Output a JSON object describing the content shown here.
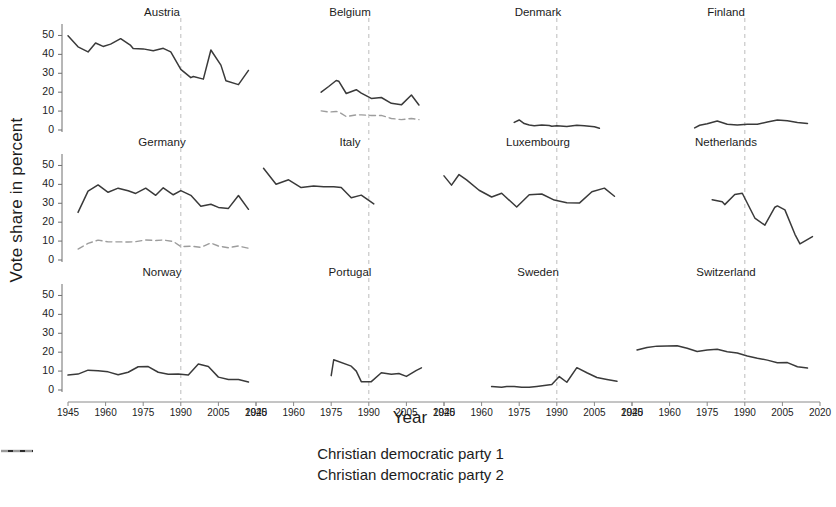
{
  "chart_data": {
    "type": "line",
    "title": "",
    "xlabel": "Year",
    "ylabel": "Vote share in percent",
    "xlim": [
      1945,
      2020
    ],
    "ylim": [
      0,
      55
    ],
    "yticks": [
      0,
      10,
      20,
      30,
      40,
      50
    ],
    "xticks": [
      1945,
      1960,
      1975,
      1990,
      2005,
      2020
    ],
    "xtick_labels": [
      "1945",
      "1960",
      "1975",
      "1990",
      "2005",
      "2020"
    ],
    "ytick_labels": [
      "0",
      "10",
      "20",
      "30",
      "40",
      "50"
    ],
    "grid": false,
    "legend_position": "bottom",
    "reference_line_x": 1990,
    "reference_line_style": "dashed",
    "layout": {
      "rows": 3,
      "cols": 4
    },
    "series_styles": [
      {
        "name": "Christian democratic party 1",
        "style": "solid",
        "color": "#3a3a3a"
      },
      {
        "name": "Christian democratic party 2",
        "style": "dashed",
        "color": "#9a9a9a"
      }
    ],
    "legend": [
      "Christian democratic party 1",
      "Christian democratic party 2"
    ],
    "panels": [
      {
        "name": "Austria",
        "series": [
          {
            "name": "Christian democratic party 1",
            "style": "solid",
            "x": [
              1945,
              1949,
              1953,
              1956,
              1959,
              1962,
              1966,
              1970,
              1971,
              1975,
              1979,
              1983,
              1986,
              1990,
              1994,
              1995,
              1999,
              2002,
              2006,
              2008,
              2013,
              2017
            ],
            "y": [
              49.8,
              44.0,
              41.3,
              46.0,
              44.2,
              45.4,
              48.3,
              44.7,
              43.1,
              42.9,
              41.9,
              43.2,
              41.3,
              32.1,
              27.7,
              28.3,
              26.9,
              42.3,
              34.3,
              26.0,
              24.0,
              31.5
            ]
          }
        ]
      },
      {
        "name": "Belgium",
        "series": [
          {
            "name": "Christian democratic party 1",
            "style": "solid",
            "x": [
              1971,
              1974,
              1977,
              1978,
              1981,
              1985,
              1987,
              1991,
              1995,
              1999,
              2003,
              2007,
              2010
            ],
            "y": [
              20.0,
              23.0,
              26.2,
              25.8,
              19.3,
              21.3,
              19.5,
              16.7,
              17.2,
              14.1,
              13.3,
              18.5,
              13.2
            ]
          },
          {
            "name": "Christian democratic party 2",
            "style": "dashed",
            "x": [
              1971,
              1974,
              1977,
              1978,
              1981,
              1985,
              1987,
              1991,
              1995,
              1999,
              2003,
              2007,
              2010
            ],
            "y": [
              10.1,
              9.5,
              9.8,
              9.6,
              7.1,
              8.0,
              8.0,
              7.7,
              7.7,
              6.1,
              5.5,
              6.1,
              5.5
            ]
          }
        ]
      },
      {
        "name": "Denmark",
        "series": [
          {
            "name": "Christian democratic party 1",
            "style": "solid",
            "x": [
              1973,
              1975,
              1977,
              1979,
              1981,
              1984,
              1987,
              1988,
              1990,
              1994,
              1998,
              2001,
              2005,
              2007
            ],
            "y": [
              4.0,
              5.3,
              3.4,
              2.6,
              2.3,
              2.7,
              2.4,
              2.0,
              2.3,
              1.8,
              2.5,
              2.3,
              1.7,
              0.9
            ]
          }
        ]
      },
      {
        "name": "Finland",
        "series": [
          {
            "name": "Christian democratic party 1",
            "style": "solid",
            "x": [
              1970,
              1972,
              1975,
              1979,
              1983,
              1987,
              1991,
              1995,
              1999,
              2003,
              2007,
              2011,
              2015
            ],
            "y": [
              1.1,
              2.5,
              3.3,
              4.8,
              3.0,
              2.6,
              3.1,
              3.0,
              4.2,
              5.3,
              4.9,
              4.0,
              3.5
            ]
          }
        ]
      },
      {
        "name": "Germany",
        "series": [
          {
            "name": "Christian democratic party 1",
            "style": "solid",
            "x": [
              1949,
              1953,
              1957,
              1961,
              1965,
              1969,
              1972,
              1976,
              1980,
              1983,
              1987,
              1990,
              1994,
              1998,
              2002,
              2005,
              2009,
              2013,
              2017
            ],
            "y": [
              25.2,
              36.4,
              39.7,
              35.8,
              38.0,
              36.6,
              35.2,
              38.0,
              34.2,
              38.2,
              34.5,
              36.7,
              34.2,
              28.4,
              29.5,
              27.8,
              27.3,
              34.1,
              26.8
            ]
          },
          {
            "name": "Christian democratic party 2",
            "style": "dashed",
            "x": [
              1949,
              1953,
              1957,
              1961,
              1965,
              1969,
              1972,
              1976,
              1980,
              1983,
              1987,
              1990,
              1994,
              1998,
              2002,
              2005,
              2009,
              2013,
              2017
            ],
            "y": [
              5.8,
              8.8,
              10.5,
              9.6,
              9.6,
              9.5,
              9.7,
              10.6,
              10.3,
              10.6,
              9.8,
              7.1,
              7.3,
              6.7,
              9.0,
              7.4,
              6.5,
              7.4,
              6.2
            ]
          }
        ]
      },
      {
        "name": "Italy",
        "series": [
          {
            "name": "Christian democratic party 1",
            "style": "solid",
            "x": [
              1948,
              1953,
              1958,
              1963,
              1968,
              1972,
              1976,
              1979,
              1983,
              1987,
              1992
            ],
            "y": [
              48.5,
              40.1,
              42.4,
              38.3,
              39.1,
              38.7,
              38.7,
              38.3,
              32.9,
              34.3,
              29.7
            ]
          }
        ]
      },
      {
        "name": "Luxembourg",
        "series": [
          {
            "name": "Christian democratic party 1",
            "style": "solid",
            "x": [
              1945,
              1948,
              1951,
              1954,
              1959,
              1964,
              1968,
              1974,
              1979,
              1984,
              1989,
              1994,
              1999,
              2004,
              2009,
              2013
            ],
            "y": [
              44.5,
              39.6,
              45.2,
              42.4,
              36.9,
              33.3,
              35.3,
              28.0,
              34.5,
              34.9,
              31.7,
              30.3,
              30.1,
              36.1,
              38.0,
              33.7
            ]
          }
        ]
      },
      {
        "name": "Netherlands",
        "series": [
          {
            "name": "Christian democratic party 1",
            "style": "solid",
            "x": [
              1977,
              1981,
              1982,
              1986,
              1989,
              1994,
              1998,
              2002,
              2003,
              2006,
              2010,
              2012,
              2017
            ],
            "y": [
              31.9,
              30.8,
              29.3,
              34.6,
              35.3,
              22.2,
              18.4,
              27.9,
              28.6,
              26.5,
              13.6,
              8.5,
              12.4
            ]
          }
        ]
      },
      {
        "name": "Norway",
        "series": [
          {
            "name": "Christian democratic party 1",
            "style": "solid",
            "x": [
              1945,
              1949,
              1953,
              1957,
              1961,
              1965,
              1969,
              1973,
              1977,
              1981,
              1985,
              1989,
              1993,
              1997,
              2001,
              2005,
              2009,
              2013,
              2017
            ],
            "y": [
              7.9,
              8.4,
              10.5,
              10.2,
              9.6,
              8.1,
              9.4,
              12.3,
              12.4,
              9.4,
              8.3,
              8.5,
              7.9,
              13.7,
              12.4,
              6.8,
              5.5,
              5.6,
              4.2
            ]
          }
        ]
      },
      {
        "name": "Portugal",
        "series": [
          {
            "name": "Christian democratic party 1",
            "style": "solid",
            "x": [
              1975,
              1976,
              1983,
              1985,
              1987,
              1991,
              1995,
              1999,
              2002,
              2005,
              2009,
              2011
            ],
            "y": [
              7.6,
              16.0,
              12.6,
              10.0,
              4.4,
              4.4,
              9.1,
              8.3,
              8.7,
              7.2,
              10.4,
              11.7
            ]
          }
        ]
      },
      {
        "name": "Sweden",
        "series": [
          {
            "name": "Christian democratic party 1",
            "style": "solid",
            "x": [
              1964,
              1968,
              1970,
              1973,
              1976,
              1979,
              1982,
              1985,
              1988,
              1991,
              1994,
              1998,
              2002,
              2006,
              2010,
              2014
            ],
            "y": [
              1.8,
              1.5,
              1.8,
              1.8,
              1.4,
              1.4,
              1.9,
              2.4,
              2.9,
              7.1,
              4.1,
              11.8,
              9.1,
              6.6,
              5.6,
              4.6
            ]
          }
        ]
      },
      {
        "name": "Switzerland",
        "series": [
          {
            "name": "Christian democratic party 1",
            "style": "solid",
            "x": [
              1947,
              1951,
              1955,
              1959,
              1963,
              1967,
              1971,
              1975,
              1979,
              1983,
              1987,
              1991,
              1995,
              1999,
              2003,
              2007,
              2011,
              2015
            ],
            "y": [
              21.2,
              22.5,
              23.2,
              23.3,
              23.4,
              22.1,
              20.4,
              21.1,
              21.5,
              20.2,
              19.6,
              18.0,
              16.8,
              15.8,
              14.4,
              14.5,
              12.3,
              11.6
            ]
          }
        ]
      }
    ]
  }
}
